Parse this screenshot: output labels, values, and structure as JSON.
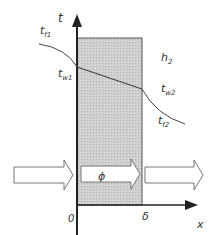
{
  "diagram": {
    "axes": {
      "y_label": "t",
      "x_label": "x",
      "origin_label": "0",
      "thickness_label": "δ"
    },
    "labels": {
      "t_f1": {
        "main": "t",
        "sub": "f1"
      },
      "t_w1": {
        "main": "t",
        "sub": "w1"
      },
      "h_2": {
        "main": "h",
        "sub": "2"
      },
      "t_w2": {
        "main": "t",
        "sub": "w2"
      },
      "t_f2": {
        "main": "t",
        "sub": "f2"
      },
      "heat_flux": "ϕ"
    },
    "colors": {
      "wall_fill": "#c8c8c8",
      "line": "#333333",
      "arrow_fill": "#ffffff"
    }
  }
}
